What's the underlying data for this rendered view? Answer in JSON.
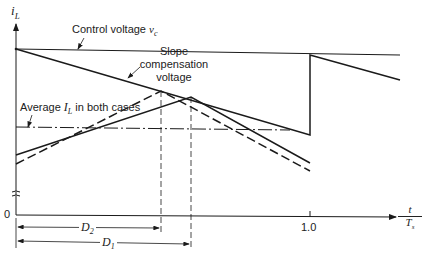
{
  "diagram": {
    "type": "peak current-mode control waveform with slope compensation",
    "y_axis": {
      "label": "i",
      "label_sub": "L",
      "origin_label": "0"
    },
    "x_axis": {
      "label_num": "t",
      "label_den": "T",
      "label_den_sub": "s",
      "tick_label": "1.0"
    },
    "labels": {
      "control_voltage": "Control voltage ",
      "control_voltage_symbol": "v",
      "control_voltage_sub": "c",
      "slope_comp_line1": "Slope",
      "slope_comp_line2": "compensation",
      "slope_comp_line3": "voltage",
      "average_prefix": "Average ",
      "average_symbol": "I",
      "average_sub": "L",
      "average_suffix": " in both cases"
    },
    "dimensions": {
      "d2": {
        "symbol": "D",
        "sub": "2"
      },
      "d1": {
        "symbol": "D",
        "sub": "1"
      }
    },
    "colors": {
      "line": "#1a1a1a",
      "background": "#ffffff"
    }
  }
}
